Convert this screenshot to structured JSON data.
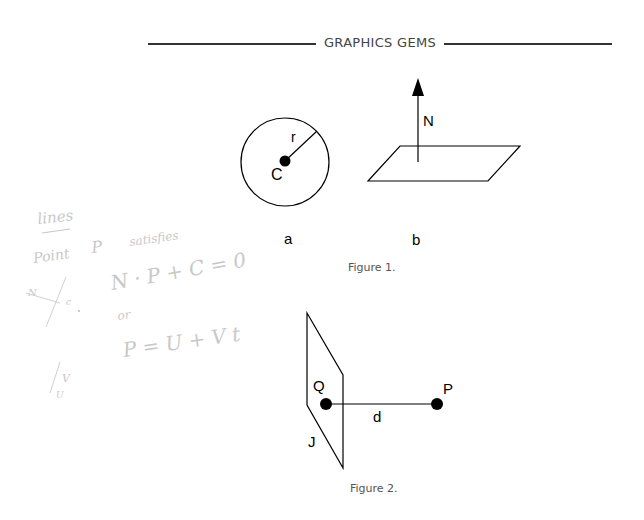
{
  "running_head": {
    "title": "GRAPHICS GEMS"
  },
  "figure1": {
    "caption": "Figure 1.",
    "panel_a": {
      "label": "a",
      "radius_label": "r",
      "center_label": "C"
    },
    "panel_b": {
      "label": "b",
      "normal_label": "N"
    }
  },
  "figure2": {
    "caption": "Figure 2.",
    "labels": {
      "plane": "J",
      "foot_point": "Q",
      "point": "P",
      "distance": "d"
    }
  },
  "handwritten_notes": {
    "heading": "lines",
    "line1": [
      "Point",
      "P",
      "satisfies"
    ],
    "equation1": "N · P + C = 0",
    "or": "or",
    "equation2": "P = U + V t",
    "sketch1_labels": [
      "N",
      "c"
    ],
    "sketch2_labels": [
      "V",
      "U"
    ]
  },
  "colors": {
    "ink": "#000000",
    "handwriting": "#c8c8c8",
    "caption": "#555555"
  }
}
